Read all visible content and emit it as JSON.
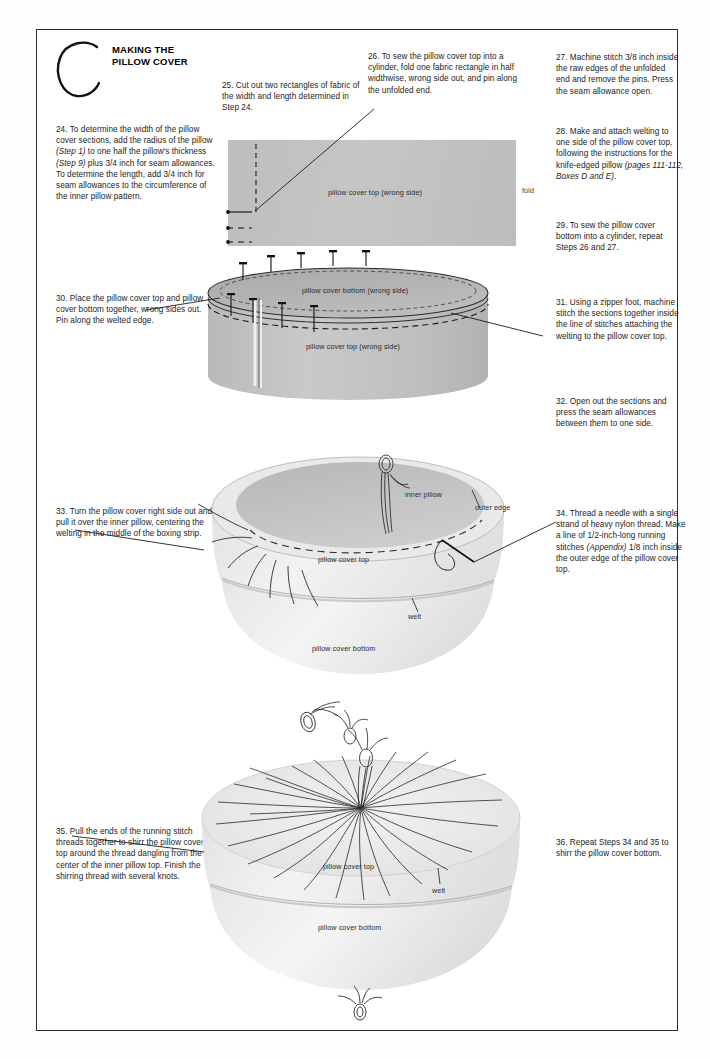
{
  "page": {
    "section_letter": "C",
    "title_line1": "MAKING THE",
    "title_line2": "PILLOW COVER",
    "width": 710,
    "height": 1059,
    "ink_color": "#232323",
    "fabric_gray": "#c2c2c2",
    "pillow_light": "#ececec"
  },
  "steps": {
    "s24": "24. To determine the width of the pillow cover sections, add the radius of the pillow (Step 1) to one half the pillow's thickness (Step 9) plus 3/4 inch for seam allowances. To determine the length, add 3/4 inch for seam allowances to the circumference of the inner pillow pattern.",
    "s25": "25. Cut out two rectangles of fabric of the width and length determined in Step 24.",
    "s26": "26. To sew the pillow cover top into a cylinder, fold one fabric rectangle in half widthwise, wrong side out, and pin along the unfolded end.",
    "s27": "27. Machine stitch 3/8 inch inside the raw edges of the unfolded end and remove the pins. Press the seam allowance open.",
    "s28": "28. Make and attach welting to one side of the pillow cover top, following the instructions for the knife-edged pillow (pages 111-112, Boxes D and E).",
    "s29": "29. To sew the pillow cover bottom into a cylinder, repeat Steps 26 and 27.",
    "s30": "30. Place the pillow cover top and pillow cover bottom together, wrong sides out. Pin along the welted edge.",
    "s31": "31. Using a zipper foot, machine stitch the sections together inside the line of stitches attaching the welting to the pillow cover top.",
    "s32": "32. Open out the sections and press the seam allowances between them to one side.",
    "s33": "33. Turn the pillow cover right side out and pull it over the inner pillow, centering the welting in the middle of the boxing strip.",
    "s34": "34. Thread a needle with a single strand of heavy nylon thread. Make a line of 1/2-inch-long running stitches (Appendix) 1/8 inch inside the outer edge of the pillow cover top.",
    "s35": "35. Pull the ends of the running stitch threads together to shirr the pillow cover top around the thread dangling from the center of the inner pillow top. Finish the shirring thread with several knots.",
    "s36": "36. Repeat Steps 34 and 35 to shirr the pillow cover bottom."
  },
  "figure1": {
    "name": "folded fabric rectangle with pins",
    "cloth_label": "pillow cover top (wrong side)",
    "fold_label": "fold",
    "pin_count": 3
  },
  "figure2": {
    "name": "pinned cylinder of two sections",
    "bottom_label": "pillow cover bottom (wrong side)",
    "top_label": "pillow cover top (wrong side)",
    "pin_count_top": 5,
    "pin_count_edge": 4
  },
  "figure3": {
    "name": "pillow cover over inner pillow with running stitches",
    "inner_pillow_label": "inner pillow",
    "outer_edge_label": "outer edge",
    "top_label": "pillow cover top",
    "welt_label": "welt",
    "bottom_label": "pillow cover bottom"
  },
  "figure4": {
    "name": "shirred pillow cover top",
    "top_label": "pillow cover top",
    "welt_label": "welt",
    "bottom_label": "pillow cover bottom",
    "gather_line_count": 26
  }
}
